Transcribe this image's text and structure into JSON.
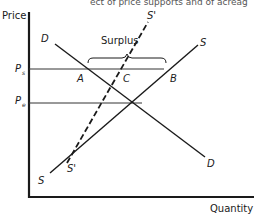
{
  "caption": "ect of price supports and of acreag",
  "axes": {
    "y_label": "Price",
    "x_label": "Quantity"
  },
  "price_levels": {
    "support": {
      "symbol": "P",
      "subscript": "s"
    },
    "equilibrium": {
      "symbol": "P",
      "subscript": "e"
    }
  },
  "curves": {
    "demand": {
      "label_top": "D",
      "label_bottom": "D"
    },
    "supply": {
      "label_top": "S",
      "label_bottom": "S"
    },
    "restricted_supply": {
      "label_top": "S'",
      "label_bottom": "S'",
      "style": "dashed"
    }
  },
  "points": {
    "a": "A",
    "b": "B",
    "c": "C"
  },
  "annotation": {
    "surplus": "Surplus"
  },
  "colors": {
    "ink": "#1a1a1a",
    "background": "#ffffff"
  }
}
